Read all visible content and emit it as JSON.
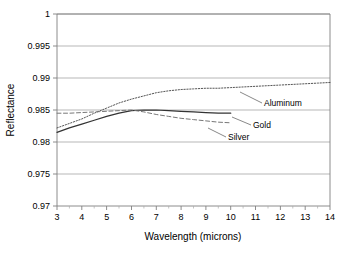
{
  "chart_data": {
    "type": "line",
    "title": "",
    "xlabel": "Wavelength (microns)",
    "ylabel": "Reflectance",
    "xlim": [
      3,
      14
    ],
    "ylim": [
      0.97,
      1
    ],
    "xticks": [
      3,
      4,
      5,
      6,
      7,
      8,
      9,
      10,
      11,
      12,
      13,
      14
    ],
    "xtick_labels": [
      "3",
      "4",
      "5",
      "6",
      "7",
      "8",
      "9",
      "10",
      "11",
      "12",
      "13",
      "14"
    ],
    "yticks": [
      0.97,
      0.975,
      0.98,
      0.985,
      0.99,
      0.995,
      1
    ],
    "ytick_labels": [
      "0.97",
      "0.975",
      "0.98",
      "0.985",
      "0.99",
      "0.995",
      "1"
    ],
    "grid": "horizontal",
    "legend_position": "inline-annotations",
    "series": [
      {
        "name": "Aluminum",
        "style": "dotted",
        "color": "#555555",
        "x": [
          3,
          3.5,
          4,
          4.5,
          5,
          5.5,
          6,
          6.5,
          7,
          7.5,
          8,
          8.5,
          9,
          9.5,
          10,
          10.5,
          11,
          11.5,
          12,
          12.5,
          13,
          13.5,
          14
        ],
        "y": [
          0.9822,
          0.9829,
          0.9836,
          0.9845,
          0.9853,
          0.9861,
          0.9867,
          0.9872,
          0.9877,
          0.988,
          0.9882,
          0.9883,
          0.9884,
          0.9884,
          0.9885,
          0.9886,
          0.9887,
          0.9888,
          0.9889,
          0.989,
          0.9891,
          0.9892,
          0.9893
        ]
      },
      {
        "name": "Gold",
        "style": "solid",
        "color": "#333333",
        "x": [
          3,
          3.5,
          4,
          4.5,
          5,
          5.5,
          6,
          6.5,
          7,
          7.5,
          8,
          8.5,
          9,
          9.5,
          10
        ],
        "y": [
          0.9815,
          0.9822,
          0.9828,
          0.9834,
          0.984,
          0.9845,
          0.9849,
          0.985,
          0.985,
          0.9849,
          0.9848,
          0.9847,
          0.9846,
          0.9845,
          0.9845
        ]
      },
      {
        "name": "Silver",
        "style": "dashed",
        "color": "#777777",
        "x": [
          3,
          3.5,
          4,
          4.5,
          5,
          5.5,
          6,
          6.5,
          7,
          7.5,
          8,
          8.5,
          9,
          9.5,
          10
        ],
        "y": [
          0.9845,
          0.9845,
          0.9846,
          0.9847,
          0.9848,
          0.9849,
          0.985,
          0.9847,
          0.9843,
          0.984,
          0.9837,
          0.9835,
          0.9833,
          0.9831,
          0.983
        ]
      }
    ],
    "annotations": [
      {
        "text": "Aluminum",
        "label_x": 264,
        "label_y": 106,
        "leader_from_x": 262,
        "leader_from_y": 103,
        "leader_to_x": 240,
        "leader_to_y": 92
      },
      {
        "text": "Gold",
        "label_x": 253,
        "label_y": 128,
        "leader_from_x": 251,
        "leader_from_y": 125,
        "leader_to_x": 232,
        "leader_to_y": 117
      },
      {
        "text": "Silver",
        "label_x": 228,
        "label_y": 140,
        "leader_from_x": 226,
        "leader_from_y": 137,
        "leader_to_x": 208,
        "leader_to_y": 128
      }
    ]
  },
  "axes": {
    "x_title": "Wavelength (microns)",
    "y_title": "Reflectance"
  },
  "colors": {
    "background": "#ffffff",
    "axis": "#808080",
    "gridline": "#999999",
    "text": "#000000",
    "aluminum": "#555555",
    "gold": "#333333",
    "silver": "#777777"
  }
}
